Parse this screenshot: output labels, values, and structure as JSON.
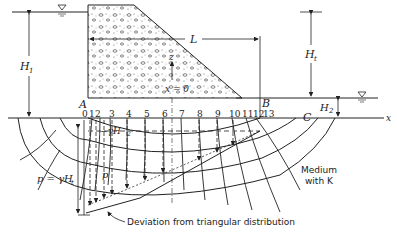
{
  "diagram": {
    "type": "flow-net under concrete dam",
    "labels": {
      "H1": "H",
      "H1_sub": "1",
      "Ht": "H",
      "Ht_sub": "t",
      "H2": "H",
      "H2_sub": "2",
      "L": "L",
      "z": "z",
      "x_axis": "x",
      "x_eq_0": "x = 0",
      "A": "A",
      "B": "B",
      "C": "C",
      "gamma_H2": "−γH",
      "gamma_H2_sub": "2",
      "p": "p",
      "p_eq": "p = γH",
      "p_eq_sub": "t",
      "medium_line1": "Medium",
      "medium_line2": "with K",
      "deviation": "Deviation from triangular distribution"
    },
    "node_numbers": [
      "0",
      "1",
      "2",
      "3",
      "4",
      "5",
      "6",
      "7",
      "8",
      "9",
      "10",
      "11",
      "12",
      "13"
    ],
    "colors": {
      "ink": "#222222",
      "background": "#ffffff"
    }
  }
}
